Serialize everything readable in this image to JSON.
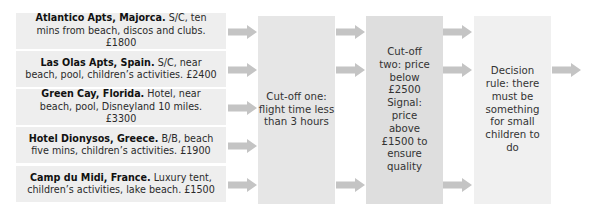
{
  "colors": {
    "option_box": "#eeeeee",
    "stage1_box": "#e6e6e6",
    "stage2_box": "#dedede",
    "stage3_box": "#f0f0f0",
    "arrow": "#c4c4c4",
    "text": "#2a2a2a"
  },
  "options": [
    {
      "name": "Atlantico Apts, Majorca.",
      "details": " S/C, ten mins from beach, discos and clubs. £1800"
    },
    {
      "name": "Las Olas Apts, Spain.",
      "details": " S/C, near beach, pool, children’s activities. £2400"
    },
    {
      "name": "Green Cay, Florida.",
      "details": " Hotel, near beach, pool, Disneyland 10 miles. £3300"
    },
    {
      "name": "Hotel Dionysos, Greece.",
      "details": " B/B, beach five mins, children’s activities. £1900"
    },
    {
      "name": "Camp du Midi, France.",
      "details": " Luxury tent, children’s activities, lake beach. £1500"
    }
  ],
  "stages": [
    {
      "label": "Cut-off one: flight time less than 3 hours"
    },
    {
      "label": "Cut-off two: price below £2500 Signal: price above £1500 to ensure quality"
    },
    {
      "label": "Decision rule: there must be something for small children to do"
    }
  ],
  "arrows": {
    "into_stage1": 5,
    "into_stage2": 3,
    "into_stage3": 2,
    "out": 1,
    "icon": "right-arrow-icon"
  }
}
